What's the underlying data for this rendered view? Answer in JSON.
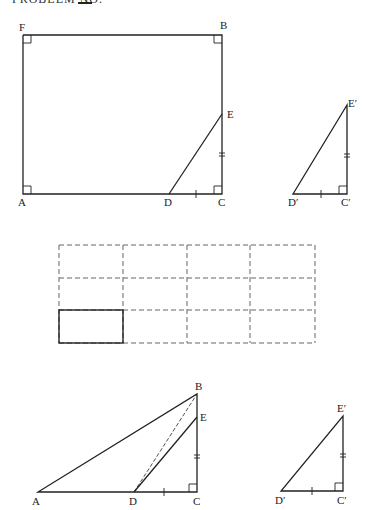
{
  "header": {
    "text": "PROBLEM NO."
  },
  "figures": {
    "rectangle": {
      "labels": {
        "F": "F",
        "B": "B",
        "E": "E",
        "A": "A",
        "D": "D",
        "C": "C"
      }
    },
    "triangle_prime_top": {
      "labels": {
        "E": "E′",
        "D": "D′",
        "C": "C′"
      }
    },
    "grid": {
      "rows": 3,
      "cols": 4,
      "highlighted_cell": "bottom-left"
    },
    "bottom_triangle": {
      "labels": {
        "B": "B",
        "E": "E",
        "A": "A",
        "D": "D",
        "C": "C"
      }
    },
    "triangle_prime_bottom": {
      "labels": {
        "E": "E′",
        "D": "D′",
        "C": "C′"
      }
    }
  },
  "colors": {
    "stroke": "#222222",
    "dash": "#666666"
  }
}
